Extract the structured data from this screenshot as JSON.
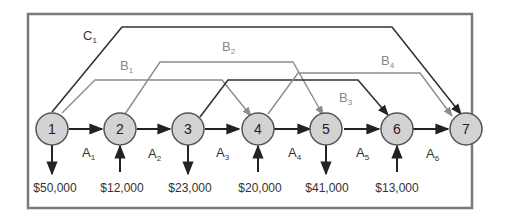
{
  "diagram": {
    "colors": {
      "frame": "#7a7a7a",
      "node_fill": "#d3d3d3",
      "node_stroke": "#555555",
      "dark_line": "#333333",
      "gray_line": "#8c8c8c",
      "text": "#333333"
    },
    "nodes": [
      {
        "id": "1",
        "label": "1",
        "cash_flow": "$50,000",
        "flow_direction": "out"
      },
      {
        "id": "2",
        "label": "2",
        "cash_flow": "$12,000",
        "flow_direction": "in"
      },
      {
        "id": "3",
        "label": "3",
        "cash_flow": "$23,000",
        "flow_direction": "out"
      },
      {
        "id": "4",
        "label": "4",
        "cash_flow": "$20,000",
        "flow_direction": "in"
      },
      {
        "id": "5",
        "label": "5",
        "cash_flow": "$41,000",
        "flow_direction": "out"
      },
      {
        "id": "6",
        "label": "6",
        "cash_flow": "$13,000",
        "flow_direction": "in"
      },
      {
        "id": "7",
        "label": "7",
        "cash_flow": null,
        "flow_direction": null
      }
    ],
    "arcs": [
      {
        "name": "A",
        "sub": "1",
        "from": "1",
        "to": "2",
        "style": "dark"
      },
      {
        "name": "A",
        "sub": "2",
        "from": "2",
        "to": "3",
        "style": "dark"
      },
      {
        "name": "A",
        "sub": "3",
        "from": "3",
        "to": "4",
        "style": "dark"
      },
      {
        "name": "A",
        "sub": "4",
        "from": "4",
        "to": "5",
        "style": "dark"
      },
      {
        "name": "A",
        "sub": "5",
        "from": "5",
        "to": "6",
        "style": "dark"
      },
      {
        "name": "A",
        "sub": "6",
        "from": "6",
        "to": "7",
        "style": "dark"
      },
      {
        "name": "B",
        "sub": "1",
        "from": "1",
        "to": "4",
        "style": "gray"
      },
      {
        "name": "B",
        "sub": "2",
        "from": "2",
        "to": "5",
        "style": "gray"
      },
      {
        "name": "B",
        "sub": "3",
        "from": "3",
        "to": "6",
        "style": "dark"
      },
      {
        "name": "B",
        "sub": "4",
        "from": "4",
        "to": "7",
        "style": "gray"
      },
      {
        "name": "C",
        "sub": "1",
        "from": "1",
        "to": "7",
        "style": "dark"
      }
    ],
    "labels": {
      "A1": {
        "main": "A",
        "sub": "1"
      },
      "A2": {
        "main": "A",
        "sub": "2"
      },
      "A3": {
        "main": "A",
        "sub": "3"
      },
      "A4": {
        "main": "A",
        "sub": "4"
      },
      "A5": {
        "main": "A",
        "sub": "5"
      },
      "A6": {
        "main": "A",
        "sub": "6"
      },
      "B1": {
        "main": "B",
        "sub": "1"
      },
      "B2": {
        "main": "B",
        "sub": "2"
      },
      "B3": {
        "main": "B",
        "sub": "3"
      },
      "B4": {
        "main": "B",
        "sub": "4"
      },
      "C1": {
        "main": "C",
        "sub": "1"
      }
    },
    "flows": {
      "n1": "$50,000",
      "n2": "$12,000",
      "n3": "$23,000",
      "n4": "$20,000",
      "n5": "$41,000",
      "n6": "$13,000"
    },
    "node_labels": {
      "n1": "1",
      "n2": "2",
      "n3": "3",
      "n4": "4",
      "n5": "5",
      "n6": "6",
      "n7": "7"
    }
  }
}
